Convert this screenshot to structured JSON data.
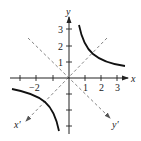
{
  "diagram": {
    "axes": {
      "x_label": "x",
      "y_label": "y",
      "x_prime_label": "x′",
      "y_prime_label": "y′"
    },
    "x_tick_labels": [
      "−2",
      "1",
      "2",
      "3"
    ],
    "y_tick_labels": [
      "1",
      "2",
      "3"
    ],
    "curve": "y = 2/x",
    "colors": {
      "curve": "#111111",
      "axes": "#222222",
      "dashed": "#777777"
    }
  }
}
